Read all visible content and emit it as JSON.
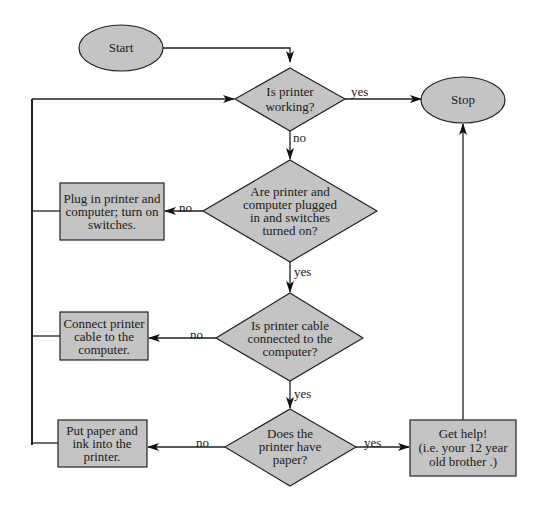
{
  "colors": {
    "shape_fill": "#c4c4c4",
    "stroke": "#222222",
    "background": "#ffffff"
  },
  "nodes": {
    "start": {
      "type": "terminal",
      "text": [
        "Start"
      ]
    },
    "stop": {
      "type": "terminal",
      "text": [
        "Stop"
      ]
    },
    "q_working": {
      "type": "decision",
      "text": [
        "Is printer",
        "working?"
      ]
    },
    "q_plugged": {
      "type": "decision",
      "text": [
        "Are printer and",
        "computer plugged",
        "in and switches",
        "turned on?"
      ]
    },
    "q_cable": {
      "type": "decision",
      "text": [
        "Is printer cable",
        "connected to the",
        "computer?"
      ]
    },
    "q_paper": {
      "type": "decision",
      "text": [
        "Does the",
        "printer have",
        "paper?"
      ]
    },
    "a_plug": {
      "type": "process",
      "text": [
        "Plug in printer and",
        "computer; turn on",
        "switches."
      ]
    },
    "a_cable": {
      "type": "process",
      "text": [
        "Connect printer",
        "cable to the",
        "computer."
      ]
    },
    "a_paper": {
      "type": "process",
      "text": [
        "Put paper and",
        "ink into the",
        "printer."
      ]
    },
    "a_help": {
      "type": "process",
      "text": [
        "Get help!",
        "(i.e. your 12 year",
        "old brother .)"
      ]
    }
  },
  "edges": [
    {
      "from": "start",
      "to": "q_working",
      "label": ""
    },
    {
      "from": "q_working",
      "to": "stop",
      "label": "yes"
    },
    {
      "from": "q_working",
      "to": "q_plugged",
      "label": "no"
    },
    {
      "from": "q_plugged",
      "to": "a_plug",
      "label": "no"
    },
    {
      "from": "q_plugged",
      "to": "q_cable",
      "label": "yes"
    },
    {
      "from": "q_cable",
      "to": "a_cable",
      "label": "no"
    },
    {
      "from": "q_cable",
      "to": "q_paper",
      "label": "yes"
    },
    {
      "from": "q_paper",
      "to": "a_paper",
      "label": "no"
    },
    {
      "from": "q_paper",
      "to": "a_help",
      "label": "yes"
    },
    {
      "from": "a_help",
      "to": "stop",
      "label": ""
    },
    {
      "from": "a_plug",
      "to": "q_working",
      "label": ""
    },
    {
      "from": "a_cable",
      "to": "q_working",
      "label": ""
    },
    {
      "from": "a_paper",
      "to": "q_working",
      "label": ""
    }
  ],
  "edge_labels": {
    "working_yes": "yes",
    "working_no": "no",
    "plugged_no": "no",
    "plugged_yes": "yes",
    "cable_no": "no",
    "cable_yes": "yes",
    "paper_no": "no",
    "paper_yes": "yes"
  }
}
